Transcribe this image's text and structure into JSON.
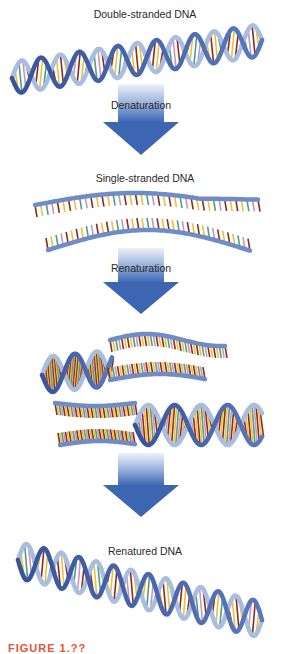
{
  "figure": {
    "stages": [
      {
        "label": "Double-stranded DNA"
      },
      {
        "label": "Single-stranded DNA"
      },
      {
        "label": "Renatured DNA"
      }
    ],
    "arrows": [
      {
        "label": "Denaturation"
      },
      {
        "label": "Renaturation"
      },
      {
        "label": ""
      }
    ],
    "caption": "FIGURE 1.??",
    "colors": {
      "backbone_dark": "#3f5fa8",
      "backbone_light": "#a9bde0",
      "arrow_top": "#e8eef8",
      "arrow_bottom": "#3d6ab8",
      "base_red": "#8a2b1f",
      "base_yellow": "#e8c23a",
      "base_green": "#4f9e86",
      "base_pink": "#c996b4",
      "caption": "#e2553b"
    }
  }
}
